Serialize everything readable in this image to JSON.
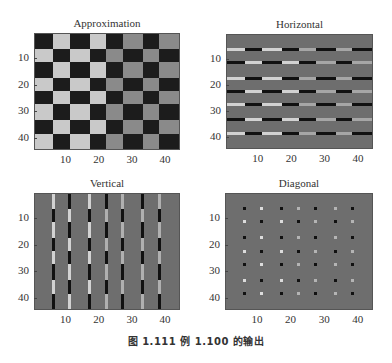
{
  "caption": "图 1.111   例 1.100 的输出",
  "chart_data": [
    {
      "type": "heatmap",
      "title": "Approximation",
      "xlabel": "",
      "ylabel": "",
      "xlim": [
        0.5,
        44.5
      ],
      "ylim": [
        44.5,
        0.5
      ],
      "xticks": [
        10,
        20,
        30,
        40
      ],
      "yticks": [
        10,
        20,
        30,
        40
      ],
      "kind": "checkerboard",
      "boundaries": [
        0.5,
        6,
        11,
        17,
        22,
        27,
        33,
        38,
        44.5
      ],
      "colors": {
        "dark": "#1c1c1c",
        "light_left": "#c9c9c9",
        "light_right": "#8a8a8a",
        "background": "#6e6e6e"
      }
    },
    {
      "type": "heatmap",
      "title": "Horizontal",
      "xlabel": "",
      "ylabel": "",
      "xlim": [
        0.5,
        44.5
      ],
      "ylim": [
        44.5,
        0.5
      ],
      "xticks": [
        10,
        20,
        30,
        40
      ],
      "yticks": [
        10,
        20,
        30,
        40
      ],
      "kind": "horizontal",
      "boundaries": [
        0.5,
        6,
        11,
        17,
        22,
        27,
        33,
        38,
        44.5
      ],
      "colors": {
        "dark": "#111111",
        "light_left": "#d2d2d2",
        "light_right": "#a6a6a6",
        "background": "#6e6e6e"
      }
    },
    {
      "type": "heatmap",
      "title": "Vertical",
      "xlabel": "",
      "ylabel": "",
      "xlim": [
        0.5,
        44.5
      ],
      "ylim": [
        44.5,
        0.5
      ],
      "xticks": [
        10,
        20,
        30,
        40
      ],
      "yticks": [
        10,
        20,
        30,
        40
      ],
      "kind": "vertical",
      "boundaries": [
        0.5,
        6,
        11,
        17,
        22,
        27,
        33,
        38,
        44.5
      ],
      "colors": {
        "dark": "#111111",
        "light_left": "#d2d2d2",
        "light_right": "#b0b0b0",
        "background": "#6e6e6e"
      }
    },
    {
      "type": "heatmap",
      "title": "Diagonal",
      "xlabel": "",
      "ylabel": "",
      "xlim": [
        0.5,
        44.5
      ],
      "ylim": [
        44.5,
        0.5
      ],
      "xticks": [
        10,
        20,
        30,
        40
      ],
      "yticks": [
        10,
        20,
        30,
        40
      ],
      "kind": "diagonal",
      "boundaries": [
        0.5,
        6,
        11,
        17,
        22,
        27,
        33,
        38,
        44.5
      ],
      "colors": {
        "dark": "#111111",
        "light_left": "#dcdcdc",
        "light_right": "#b4b4b4",
        "background": "#6e6e6e"
      }
    }
  ]
}
